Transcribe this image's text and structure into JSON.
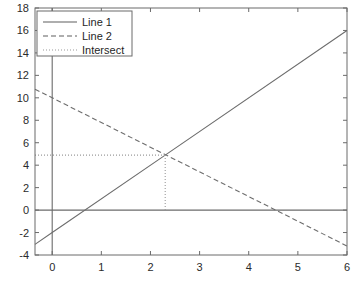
{
  "chart_data": {
    "type": "line",
    "title": "",
    "xlabel": "",
    "ylabel": "",
    "xlim": [
      -0.35,
      6.0
    ],
    "ylim": [
      -4,
      18
    ],
    "xticks": [
      "0",
      "1",
      "2",
      "3",
      "4",
      "5",
      "6"
    ],
    "xtick_values": [
      0,
      1,
      2,
      3,
      4,
      5,
      6
    ],
    "yticks": [
      "-4",
      "-2",
      "0",
      "2",
      "4",
      "6",
      "8",
      "10",
      "12",
      "14",
      "16",
      "18"
    ],
    "ytick_values": [
      -4,
      -2,
      0,
      2,
      4,
      6,
      8,
      10,
      12,
      14,
      16,
      18
    ],
    "grid": false,
    "legend_position": "upper left",
    "series": [
      {
        "name": "Line 1",
        "style": "solid",
        "color": "#6d6d6d",
        "x": [
          -0.35,
          0,
          2.3,
          6
        ],
        "y": [
          -3.05,
          -2.0,
          4.9,
          16.0
        ]
      },
      {
        "name": "Line 2",
        "style": "dashed",
        "color": "#6d6d6d",
        "x": [
          -0.35,
          0,
          2.3,
          4.55,
          6
        ],
        "y": [
          10.77,
          10.0,
          4.94,
          0.0,
          -3.2
        ]
      },
      {
        "name": "Intersect",
        "style": "dotted",
        "color": "#9a9a9a",
        "intersection_x": 2.3,
        "intersection_y": 4.9,
        "guide_horizontal_from_x": -0.35,
        "guide_vertical_to_y": 0
      }
    ],
    "legend_entries": [
      {
        "label": "Line 1",
        "style": "solid"
      },
      {
        "label": "Line 2",
        "style": "dashed"
      },
      {
        "label": "Intersect",
        "style": "dotted"
      }
    ],
    "zero_lines": {
      "horizontal_y": 0,
      "vertical_x": 0
    }
  }
}
